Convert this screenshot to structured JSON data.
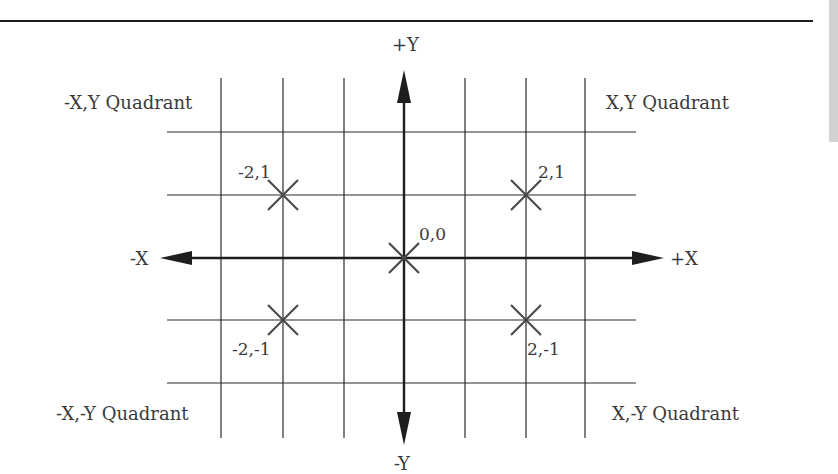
{
  "diagram": {
    "colors": {
      "line": "#2a2a2a",
      "text": "#3a3a3a",
      "marker": "#4a4a4a",
      "side_tab": "#d2d2d2"
    },
    "axes": {
      "x_positive_label": "+X",
      "x_negative_label": "-X",
      "y_positive_label": "+Y",
      "y_negative_label": "-Y"
    },
    "quadrants": {
      "top_left": "-X,Y Quadrant",
      "top_right": "X,Y Quadrant",
      "bottom_left": "-X,-Y Quadrant",
      "bottom_right": "X,-Y Quadrant"
    },
    "points": [
      {
        "label": "-2,1",
        "x": -2,
        "y": 1
      },
      {
        "label": "2,1",
        "x": 2,
        "y": 1
      },
      {
        "label": "0,0",
        "x": 0,
        "y": 0
      },
      {
        "label": "-2,-1",
        "x": -2,
        "y": -1
      },
      {
        "label": "2,-1",
        "x": 2,
        "y": -1
      }
    ],
    "grid": {
      "x_range": [
        -3,
        3
      ],
      "y_range": [
        -2,
        2
      ],
      "step": 1
    }
  }
}
